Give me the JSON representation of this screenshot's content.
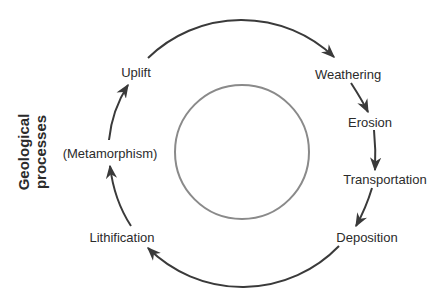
{
  "diagram": {
    "type": "cycle",
    "side_title": {
      "line1": "Geological",
      "line2": "processes"
    },
    "stages": [
      {
        "id": "uplift",
        "label": "Uplift"
      },
      {
        "id": "weathering",
        "label": "Weathering"
      },
      {
        "id": "erosion",
        "label": "Erosion"
      },
      {
        "id": "transportation",
        "label": "Transportation"
      },
      {
        "id": "deposition",
        "label": "Deposition"
      },
      {
        "id": "lithification",
        "label": "Lithification"
      },
      {
        "id": "metamorphism",
        "label": "(Metamorphism)"
      }
    ],
    "flow": [
      "Uplift",
      "Weathering",
      "Erosion",
      "Transportation",
      "Deposition",
      "Lithification",
      "(Metamorphism)",
      "Uplift"
    ],
    "colors": {
      "arrows": "#3a3a3a",
      "inner_circle": "#8a8a8a",
      "text": "#2b2b2b"
    }
  }
}
